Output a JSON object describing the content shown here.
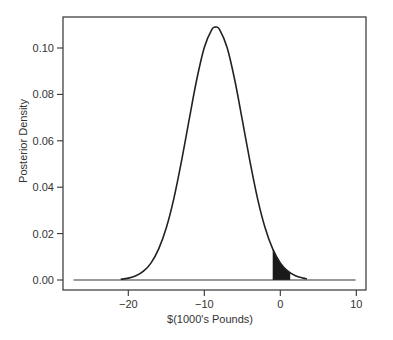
{
  "chart_data": {
    "type": "line",
    "title": "",
    "xlabel": "$(1000's Pounds)",
    "ylabel": "Posterior Density",
    "xlim": [
      -27,
      10
    ],
    "ylim": [
      0,
      0.11
    ],
    "grid": false,
    "legend": null,
    "x_ticks": [
      {
        "value": -20,
        "label": "−20"
      },
      {
        "value": -10,
        "label": "−10"
      },
      {
        "value": 0,
        "label": "0"
      },
      {
        "value": 10,
        "label": "10"
      }
    ],
    "y_ticks": [
      {
        "value": 0.0,
        "label": "0.00"
      },
      {
        "value": 0.02,
        "label": "0.02"
      },
      {
        "value": 0.04,
        "label": "0.04"
      },
      {
        "value": 0.06,
        "label": "0.06"
      },
      {
        "value": 0.08,
        "label": "0.08"
      },
      {
        "value": 0.1,
        "label": "0.10"
      }
    ],
    "series": [
      {
        "name": "Posterior density",
        "distribution": {
          "family": "normal",
          "mean": -8.5,
          "sd": 3.66,
          "peak_density": 0.109
        },
        "x": [
          -21,
          -20,
          -19,
          -18,
          -17,
          -16,
          -15,
          -14,
          -13,
          -12,
          -11,
          -10,
          -9,
          -8.5,
          -8,
          -7,
          -6,
          -5,
          -4,
          -3,
          -2,
          -1,
          0,
          1,
          2,
          3,
          3.5
        ],
        "y": [
          0.0003,
          0.0008,
          0.0018,
          0.0038,
          0.0074,
          0.0134,
          0.0225,
          0.0352,
          0.0512,
          0.069,
          0.0863,
          0.1002,
          0.108,
          0.109,
          0.108,
          0.1002,
          0.0863,
          0.069,
          0.0512,
          0.0352,
          0.0225,
          0.0134,
          0.0074,
          0.0038,
          0.0018,
          0.0008,
          0.0005
        ]
      }
    ],
    "baseline": {
      "y": 0,
      "x_from": -27.2,
      "x_to": 9.9
    },
    "shaded_region": {
      "x_from": -1.0,
      "x_to": 1.3,
      "fill": "#1a1a1a",
      "description": "tail area under curve near zero"
    }
  }
}
